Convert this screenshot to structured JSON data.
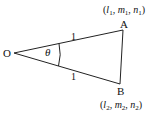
{
  "diagram": {
    "type": "triangle-angle-between-lines",
    "points": {
      "O": {
        "label": "O",
        "x": 14,
        "y": 53
      },
      "A": {
        "label": "A",
        "x": 123,
        "y": 30
      },
      "B": {
        "label": "B",
        "x": 120,
        "y": 84
      }
    },
    "coordinates": {
      "A": {
        "open": "(",
        "l": "l",
        "l_sub": "1",
        "m": "m",
        "m_sub": "1",
        "n": "n",
        "n_sub": "1",
        "close": ")",
        "sep": ", "
      },
      "B": {
        "open": "(",
        "l": "l",
        "l_sub": "2",
        "m": "m",
        "m_sub": "2",
        "n": "n",
        "n_sub": "2",
        "close": ")",
        "sep": ", "
      }
    },
    "edge_labels": {
      "OA": "1",
      "OB": "1"
    },
    "angle_label": "θ",
    "colors": {
      "stroke": "#222222",
      "text": "#111111",
      "background": "#ffffff"
    }
  }
}
